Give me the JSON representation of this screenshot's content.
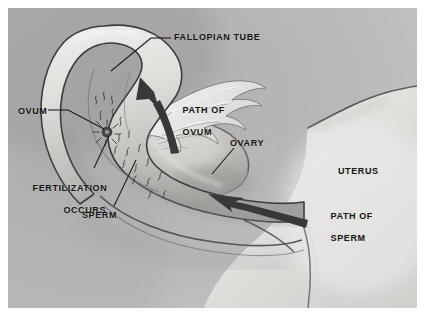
{
  "figure": {
    "medium": "graphite pencil illustration",
    "background_color": "#b9b9b9",
    "ink_color": "#151515",
    "arrow_color": "#2e2e2e"
  },
  "labels": {
    "fallopian_tube": "FALLOPIAN TUBE",
    "ovum": "OVUM",
    "fertilization_line1": "FERTILIZATION",
    "fertilization_line2": "OCCURS",
    "sperm": "SPERM",
    "path_of_ovum_line1": "PATH OF",
    "path_of_ovum_line2": "OVUM",
    "ovary": "OVARY",
    "uterus": "UTERUS",
    "path_of_sperm_line1": "PATH OF",
    "path_of_sperm_line2": "SPERM"
  },
  "leader_lines": [
    {
      "name": "fallopian-tube-leader",
      "from": [
        163,
        30
      ],
      "to": [
        103,
        63
      ]
    },
    {
      "name": "ovum-leader",
      "from": [
        44,
        102
      ],
      "to": [
        97,
        122
      ]
    },
    {
      "name": "fertilization-leader",
      "from": [
        86,
        162
      ],
      "to": [
        101,
        128
      ]
    },
    {
      "name": "sperm-leader",
      "from": [
        106,
        200
      ],
      "to": [
        127,
        155
      ]
    },
    {
      "name": "ovary-leader",
      "from": [
        226,
        140
      ],
      "to": [
        203,
        165
      ]
    }
  ],
  "arrows": [
    {
      "name": "path-of-ovum-arrow",
      "direction": "up-left",
      "label": "PATH OF OVUM"
    },
    {
      "name": "path-of-sperm-arrow",
      "direction": "left",
      "label": "PATH OF SPERM"
    }
  ],
  "anatomy": [
    {
      "name": "fallopian-tube",
      "description": "curved tube arching from upper left down to the uterus"
    },
    {
      "name": "fimbriae",
      "description": "wispy finger-like projections at the tube's funnel end"
    },
    {
      "name": "ovary",
      "description": "oval body beneath the fimbriae"
    },
    {
      "name": "uterus",
      "description": "large light mass on the right"
    },
    {
      "name": "ovum",
      "description": "dark round cell at the fertilization site"
    },
    {
      "name": "sperm-trail",
      "description": "stream of tadpole-shaped sperm moving up the tube"
    }
  ]
}
